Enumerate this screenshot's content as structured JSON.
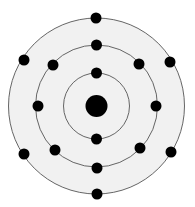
{
  "diagram": {
    "type": "bohr-atom-model",
    "element_guess": "Sulfur",
    "total_electrons": 16,
    "center": {
      "x": 96.5,
      "y": 106
    },
    "nucleus": {
      "radius": 11,
      "color": "#000000"
    },
    "fill_color": "#f1f1f1",
    "ring_color": "#555555",
    "electron_color": "#000000",
    "electron_radius": 5.5,
    "shells": [
      {
        "name": "shell-1",
        "radius": 33,
        "electron_count": 2,
        "electrons": [
          {
            "x": 96.5,
            "y": 73
          },
          {
            "x": 96.5,
            "y": 139
          }
        ]
      },
      {
        "name": "shell-2",
        "radius": 61,
        "electron_count": 8,
        "electrons": [
          {
            "x": 96.5,
            "y": 45
          },
          {
            "x": 139,
            "y": 64
          },
          {
            "x": 156,
            "y": 106
          },
          {
            "x": 140,
            "y": 148
          },
          {
            "x": 97,
            "y": 168
          },
          {
            "x": 55,
            "y": 150
          },
          {
            "x": 38,
            "y": 106
          },
          {
            "x": 53,
            "y": 65
          }
        ]
      },
      {
        "name": "shell-3",
        "radius": 88,
        "electron_count": 6,
        "electrons": [
          {
            "x": 96,
            "y": 18
          },
          {
            "x": 170,
            "y": 62
          },
          {
            "x": 171,
            "y": 152
          },
          {
            "x": 97,
            "y": 194
          },
          {
            "x": 24,
            "y": 154
          },
          {
            "x": 24,
            "y": 60
          }
        ]
      }
    ]
  }
}
